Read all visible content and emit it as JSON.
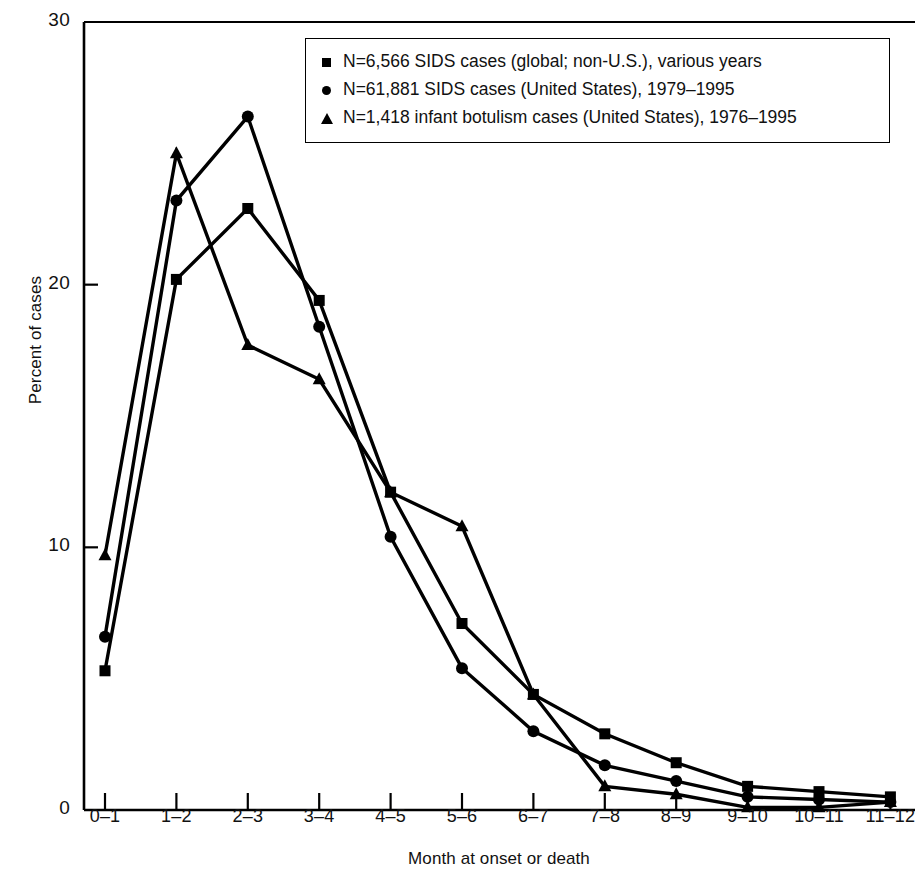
{
  "chart_data": {
    "type": "line",
    "title": "",
    "xlabel": "Month at onset or death",
    "ylabel": "Percent of cases",
    "categories": [
      "0–1",
      "1–2",
      "2–3",
      "3–4",
      "4–5",
      "5–6",
      "6–7",
      "7–8",
      "8–9",
      "9–10",
      "10–11",
      "11–12"
    ],
    "ylim": [
      0,
      30
    ],
    "yticks": [
      0,
      10,
      20,
      30
    ],
    "ytick_labels": [
      "0",
      "10",
      "20",
      "30"
    ],
    "grid": false,
    "legend_position": "top-right",
    "series": [
      {
        "name": "N=6,566 SIDS cases (global; non-U.S.), various years",
        "marker": "square",
        "values": [
          5.3,
          20.2,
          22.9,
          19.4,
          12.1,
          7.1,
          4.4,
          2.9,
          1.8,
          0.9,
          0.7,
          0.5
        ]
      },
      {
        "name": "N=61,881 SIDS cases (United States), 1979–1995",
        "marker": "circle",
        "values": [
          6.6,
          23.2,
          26.4,
          18.4,
          10.4,
          5.4,
          3.0,
          1.7,
          1.1,
          0.5,
          0.4,
          0.3
        ]
      },
      {
        "name": "N=1,418 infant botulism cases (United States), 1976–1995",
        "marker": "triangle",
        "values": [
          9.7,
          25.0,
          17.7,
          16.4,
          12.1,
          10.8,
          4.4,
          0.9,
          0.6,
          0.1,
          0.1,
          0.3
        ]
      }
    ]
  },
  "legend": {
    "items": [
      {
        "marker": "square",
        "label": "N=6,566 SIDS cases (global; non-U.S.), various years"
      },
      {
        "marker": "circle",
        "label": "N=61,881 SIDS cases (United States), 1979–1995"
      },
      {
        "marker": "triangle",
        "label": "N=1,418 infant botulism cases (United States), 1976–1995"
      }
    ]
  },
  "axes": {
    "y_title": "Percent of cases",
    "x_title": "Month at onset or death"
  },
  "colors": {
    "line": "#000000",
    "axis": "#000000",
    "background": "#ffffff"
  }
}
